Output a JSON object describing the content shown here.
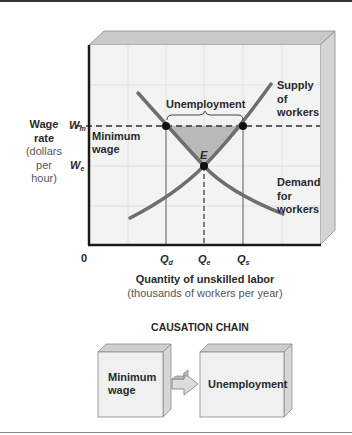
{
  "chart": {
    "y_axis": {
      "title": "Wage",
      "title2": "rate",
      "units1": "(dollars",
      "units2": "per",
      "units3": "hour)"
    },
    "y_ticks": {
      "wm": "W",
      "wm_sub": "m",
      "we": "W",
      "we_sub": "e"
    },
    "x_axis": {
      "title": "Quantity of unskilled labor",
      "units": "(thousands of workers per year)",
      "origin": "0"
    },
    "x_ticks": {
      "qd": "Q",
      "qd_sub": "d",
      "qe": "Q",
      "qe_sub": "e",
      "qs": "Q",
      "qs_sub": "s"
    },
    "labels": {
      "unemployment": "Unemployment",
      "minimum_wage_1": "Minimum",
      "minimum_wage_2": "wage",
      "equilibrium": "E",
      "supply_1": "Supply",
      "supply_2": "of",
      "supply_3": "workers",
      "demand_1": "Demand",
      "demand_2": "for",
      "demand_3": "workers"
    },
    "colors": {
      "curve": "#6e6e6e",
      "shade": "#b9b9b9",
      "face": "#f2f2f2",
      "bevel": "#c8c8c8",
      "axis": "#1a1a1a"
    }
  },
  "causation_chain": {
    "title": "CAUSATION CHAIN",
    "cause_1": "Minimum",
    "cause_2": "wage",
    "effect": "Unemployment"
  }
}
